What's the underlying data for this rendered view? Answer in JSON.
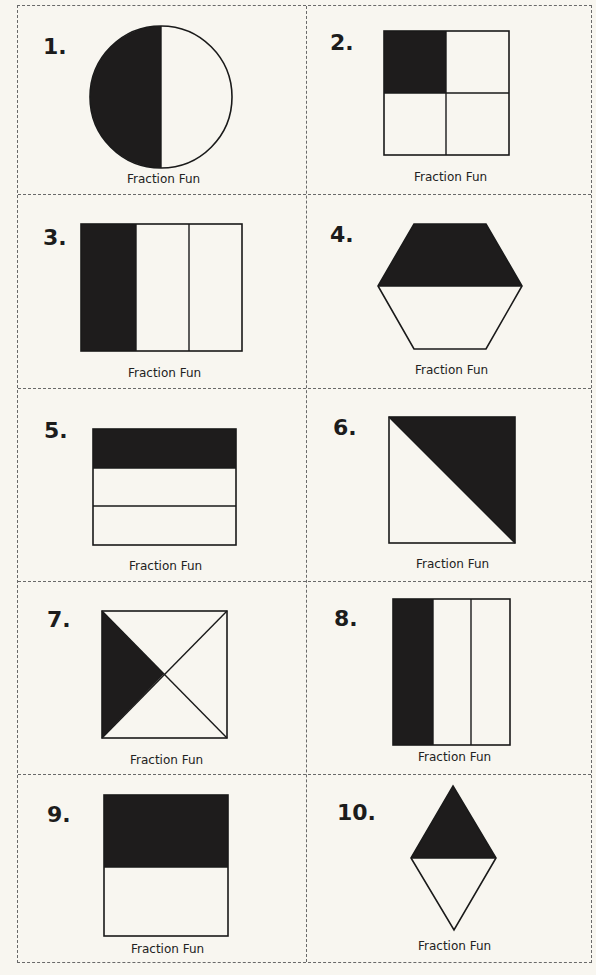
{
  "worksheet": {
    "caption": "Fraction Fun",
    "colors": {
      "shaded": "#1e1c1c",
      "unshaded": "#fdfcf8",
      "stroke": "#1a1a1a",
      "paper": "#f8f6f0",
      "border": "#6a6a6a"
    },
    "items": [
      {
        "number": "1.",
        "shape": "circle",
        "parts": 2,
        "shaded": 1,
        "caption": "Fraction Fun"
      },
      {
        "number": "2.",
        "shape": "square",
        "parts": 4,
        "shaded": 1,
        "caption": "Fraction Fun"
      },
      {
        "number": "3.",
        "shape": "rectangle-vertical-strips",
        "parts": 3,
        "shaded": 1,
        "caption": "Fraction Fun"
      },
      {
        "number": "4.",
        "shape": "hexagon",
        "parts": 2,
        "shaded": 1,
        "caption": "Fraction Fun"
      },
      {
        "number": "5.",
        "shape": "rectangle-horizontal-strips",
        "parts": 3,
        "shaded": 1,
        "caption": "Fraction Fun"
      },
      {
        "number": "6.",
        "shape": "square-diagonal",
        "parts": 2,
        "shaded": 1,
        "caption": "Fraction Fun"
      },
      {
        "number": "7.",
        "shape": "square-x-diagonals",
        "parts": 4,
        "shaded": 1,
        "caption": "Fraction Fun"
      },
      {
        "number": "8.",
        "shape": "rectangle-vertical-strips",
        "parts": 3,
        "shaded": 1,
        "caption": "Fraction Fun"
      },
      {
        "number": "9.",
        "shape": "square-horizontal-halves",
        "parts": 2,
        "shaded": 1,
        "caption": "Fraction Fun"
      },
      {
        "number": "10.",
        "shape": "rhombus",
        "parts": 2,
        "shaded": 1,
        "caption": "Fraction Fun"
      }
    ]
  }
}
